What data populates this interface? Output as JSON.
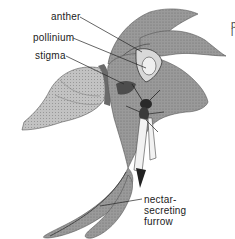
{
  "figure": {
    "labels": [
      {
        "id": "anther",
        "text": "anther"
      },
      {
        "id": "pollinium",
        "text": "pollinium"
      },
      {
        "id": "stigma",
        "text": "stigma"
      },
      {
        "id": "nectar-secreting-furrow",
        "lines": [
          "nectar-",
          "secreting",
          "furrow"
        ]
      }
    ],
    "edge_fragment": [
      "p",
      "i"
    ]
  },
  "colors": {
    "background": "#ffffff",
    "petal_fill": "#8f8f8f",
    "petal_dark": "#5a5a5a",
    "ovary_fill": "#b8b8b8",
    "leader_line": "#222222",
    "label_text": "#222222"
  }
}
